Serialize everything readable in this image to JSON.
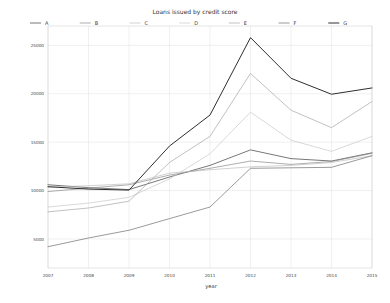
{
  "chart_data": {
    "type": "line",
    "title": "Loans issued by credit score",
    "xlabel": "year",
    "ylabel": "",
    "grid": true,
    "legend_position": "top",
    "x": [
      2007,
      2008,
      2009,
      2010,
      2011,
      2012,
      2013,
      2014,
      2015
    ],
    "categories": [
      "2007",
      "2008",
      "2009",
      "2010",
      "2011",
      "2012",
      "2013",
      "2014",
      "2015"
    ],
    "xlim": [
      2007,
      2015
    ],
    "ylim": [
      2000,
      27000
    ],
    "yticks": [
      5000,
      10000,
      15000,
      20000,
      25000
    ],
    "ytick_labels": [
      "5000",
      "10000",
      "15000",
      "20000",
      "25000"
    ],
    "xticks": [
      2007,
      2008,
      2009,
      2010,
      2011,
      2012,
      2013,
      2014,
      2015
    ],
    "series": [
      {
        "name": "A",
        "color": "#4a4a4a",
        "style": "solid",
        "width": 0.75,
        "values": [
          10600,
          10300,
          10100,
          11400,
          12600,
          14200,
          13300,
          13050,
          13900
        ]
      },
      {
        "name": "B",
        "color": "#8a8a8a",
        "style": "solid",
        "width": 0.7,
        "values": [
          9900,
          10250,
          10600,
          11600,
          12300,
          13050,
          12700,
          13000,
          13850
        ]
      },
      {
        "name": "C",
        "color": "#bdbdbd",
        "style": "solid",
        "width": 0.7,
        "values": [
          10350,
          10500,
          10700,
          11800,
          12150,
          12450,
          12600,
          12900,
          13600
        ]
      },
      {
        "name": "D",
        "color": "#c8c8c8",
        "style": "solid",
        "width": 0.7,
        "values": [
          8300,
          8700,
          9300,
          11200,
          13800,
          18100,
          15200,
          14050,
          15600
        ]
      },
      {
        "name": "E",
        "color": "#a6a6a6",
        "style": "solid",
        "width": 0.7,
        "values": [
          7800,
          8200,
          8900,
          12900,
          15600,
          22100,
          18300,
          16500,
          19200
        ]
      },
      {
        "name": "F",
        "color": "#787878",
        "style": "solid",
        "width": 0.75,
        "values": [
          4200,
          5100,
          5900,
          7100,
          8300,
          12300,
          12350,
          12400,
          13600
        ]
      },
      {
        "name": "G",
        "color": "#2e2e2e",
        "style": "solid",
        "width": 1.0,
        "values": [
          10400,
          10150,
          10050,
          14600,
          17800,
          25800,
          21600,
          19950,
          20600
        ]
      }
    ]
  },
  "legend": {
    "entries": [
      {
        "label": "A"
      },
      {
        "label": "B"
      },
      {
        "label": "C"
      },
      {
        "label": "D"
      },
      {
        "label": "E"
      },
      {
        "label": "F"
      },
      {
        "label": "G"
      }
    ]
  }
}
